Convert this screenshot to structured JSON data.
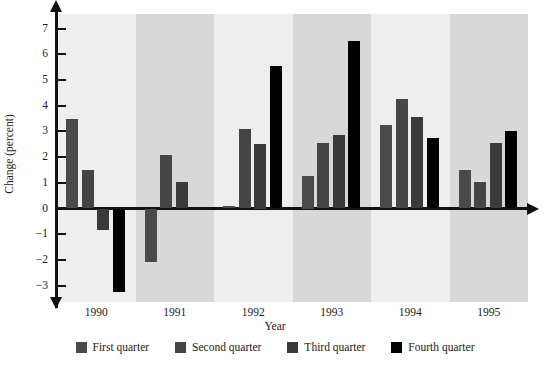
{
  "chart_data": {
    "type": "bar",
    "title": "",
    "xlabel": "Year",
    "ylabel": "Change (percent)",
    "categories": [
      "1990",
      "1991",
      "1992",
      "1993",
      "1994",
      "1995"
    ],
    "ylim": [
      -3.6,
      7.4
    ],
    "yticks": [
      "7",
      "6",
      "5",
      "4",
      "3",
      "2",
      "1",
      "0",
      "−1",
      "−2",
      "−3"
    ],
    "ytick_values": [
      7,
      6,
      5,
      4,
      3,
      2,
      1,
      0,
      -1,
      -2,
      -3
    ],
    "grid": false,
    "legend_position": "bottom",
    "series": [
      {
        "name": "First quarter",
        "color": "#4a4a4a",
        "values": [
          3.5,
          -2.1,
          0.1,
          1.25,
          3.25,
          1.5
        ]
      },
      {
        "name": "Second quarter",
        "color": "#454545",
        "values": [
          1.5,
          2.1,
          3.1,
          2.55,
          4.25,
          1.05
        ]
      },
      {
        "name": "Third quarter",
        "color": "#3a3a3a",
        "values": [
          -0.85,
          1.05,
          2.5,
          2.85,
          3.55,
          2.55
        ]
      },
      {
        "name": "Fourth quarter",
        "color": "#000000",
        "values": [
          -3.25,
          0.0,
          5.55,
          6.5,
          2.75,
          3.0
        ]
      }
    ]
  },
  "legend": {
    "items": [
      {
        "label": "First quarter",
        "color": "#4a4a4a"
      },
      {
        "label": "Second quarter",
        "color": "#454545"
      },
      {
        "label": "Third quarter",
        "color": "#3a3a3a"
      },
      {
        "label": "Fourth quarter",
        "color": "#000000"
      }
    ]
  }
}
